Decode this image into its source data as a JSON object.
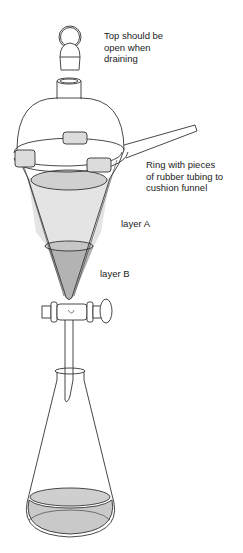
{
  "diagram": {
    "labels": {
      "top_note": "Top should be\nopen when\ndraining",
      "ring_note": "Ring with pieces\nof rubber tubing to\ncushion funnel",
      "layer_a": "layer A",
      "layer_b": "layer B"
    },
    "components": [
      "stopper",
      "separatory-funnel",
      "ring-stand-ring",
      "rubber-tubing",
      "stopcock",
      "erlenmeyer-flask"
    ],
    "colors": {
      "line": "#333333",
      "liquid_light": "#e2e2e2",
      "liquid_dark": "#b5b5b5",
      "background": "#ffffff"
    }
  }
}
